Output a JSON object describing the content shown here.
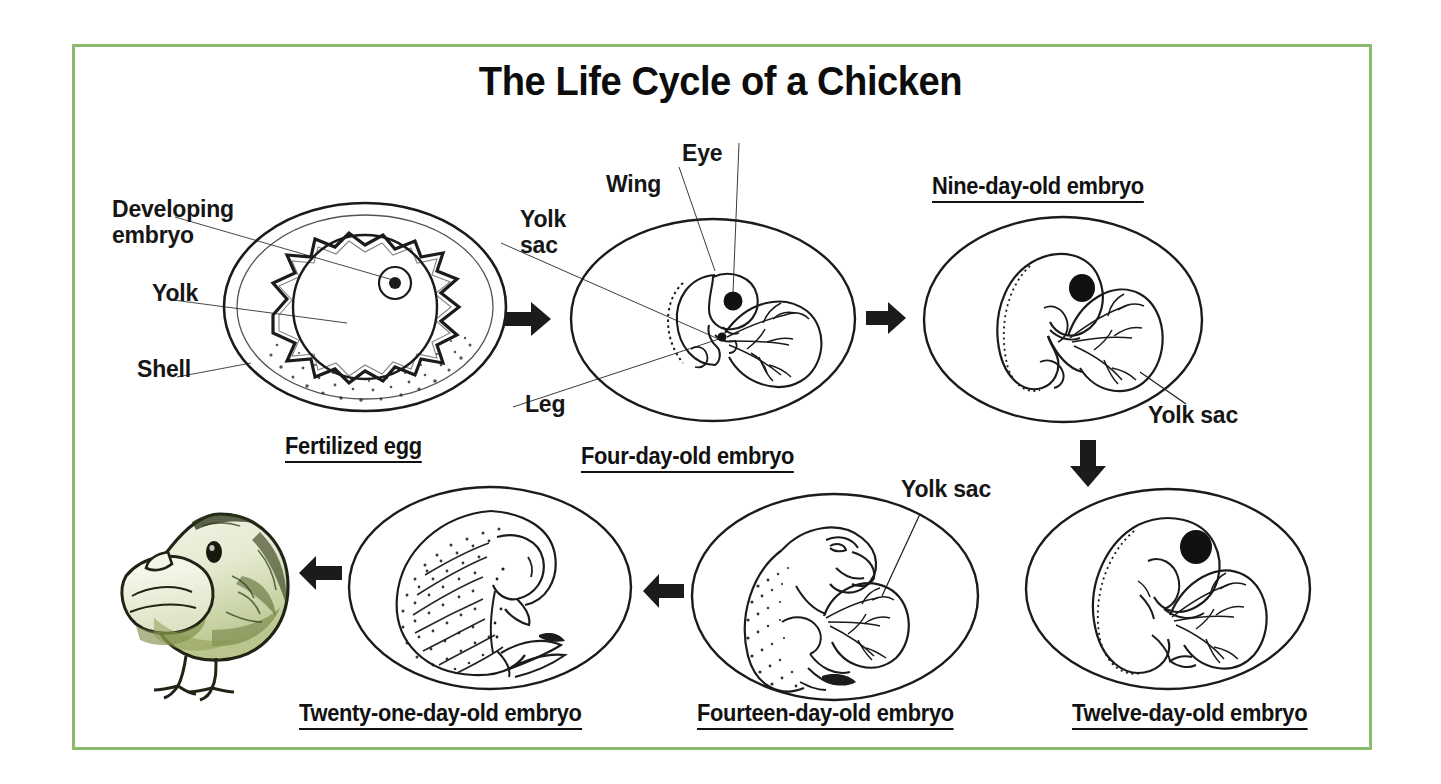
{
  "poster": {
    "title": "The Life Cycle of a Chicken",
    "border_color": "#8cbb6e",
    "background_color": "#ffffff",
    "ink_color": "#1b1b1b"
  },
  "stages": [
    {
      "id": "fertilized-egg",
      "caption": "Fertilized egg",
      "labels": [
        "Developing embryo",
        "Yolk",
        "Shell"
      ]
    },
    {
      "id": "four-day-old-embryo",
      "caption": "Four-day-old embryo",
      "labels": [
        "Eye",
        "Wing",
        "Yolk sac",
        "Leg"
      ]
    },
    {
      "id": "nine-day-old-embryo",
      "caption": "Nine-day-old embryo",
      "labels": [
        "Yolk sac"
      ]
    },
    {
      "id": "twelve-day-old-embryo",
      "caption": "Twelve-day-old embryo",
      "labels": []
    },
    {
      "id": "fourteen-day-old-embryo",
      "caption": "Fourteen-day-old embryo",
      "labels": [
        "Yolk sac"
      ]
    },
    {
      "id": "twenty-one-day-old-embryo",
      "caption": "Twenty-one-day-old embryo",
      "labels": []
    },
    {
      "id": "hatched-chick",
      "caption": "",
      "labels": []
    }
  ],
  "labels": {
    "developing_embryo_line1": "Developing",
    "developing_embryo_line2": "embryo",
    "yolk": "Yolk",
    "shell": "Shell",
    "eye": "Eye",
    "wing": "Wing",
    "yolk_sac_line1": "Yolk",
    "yolk_sac_line2": "sac",
    "leg": "Leg",
    "yolk_sac_nine": "Yolk sac",
    "yolk_sac_fourteen": "Yolk sac"
  },
  "captions": {
    "fertilized_egg": "Fertilized egg",
    "four_day": "Four-day-old embryo",
    "nine_day": "Nine-day-old embryo",
    "twelve_day": "Twelve-day-old embryo",
    "fourteen_day": "Fourteen-day-old embryo",
    "twentyone_day": "Twenty-one-day-old embryo"
  },
  "arrows": [
    {
      "name": "arrow-egg-to-four-day",
      "direction": "right"
    },
    {
      "name": "arrow-four-day-to-nine-day",
      "direction": "right"
    },
    {
      "name": "arrow-nine-day-to-twelve-day",
      "direction": "down"
    },
    {
      "name": "arrow-twelve-day-to-fourteen-day",
      "direction": "left"
    },
    {
      "name": "arrow-fourteen-day-to-twentyone-day",
      "direction": "left"
    },
    {
      "name": "arrow-twentyone-day-to-chick",
      "direction": "left"
    }
  ]
}
